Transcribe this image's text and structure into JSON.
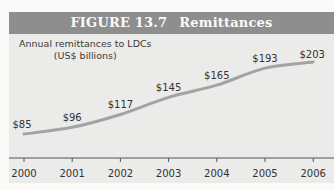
{
  "figure": {
    "label": "FIGURE 13.7",
    "title": "Remittances",
    "subtitle_line1": "Annual remittances to LDCs",
    "subtitle_line2": "(US$ billions)"
  },
  "colors": {
    "header_bg": "#8e8e8e",
    "panel_bg": "#ebebea",
    "line": "#a3a3a3",
    "text": "#333333"
  },
  "chart_data": {
    "type": "line",
    "subtitle": "Annual remittances to LDCs (US$ billions)",
    "xlabel": "",
    "ylabel": "US$ billions",
    "categories": [
      "2000",
      "2001",
      "2002",
      "2003",
      "2004",
      "2005",
      "2006"
    ],
    "values": [
      85,
      96,
      117,
      145,
      165,
      193,
      203
    ],
    "data_labels": [
      "$85",
      "$96",
      "$117",
      "$145",
      "$165",
      "$193",
      "$203"
    ],
    "grid": false,
    "legend": null
  }
}
